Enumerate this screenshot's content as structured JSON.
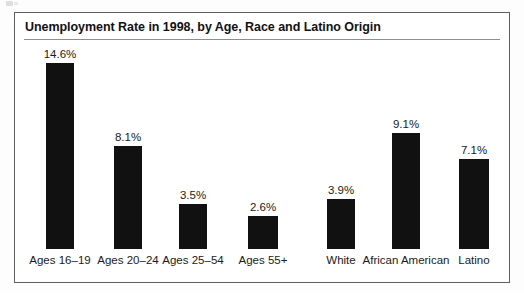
{
  "chart_data": {
    "type": "bar",
    "title": "Unemployment Rate in 1998, by Age, Race and Latino Origin",
    "xlabel": "",
    "ylabel": "",
    "ylim": [
      0,
      14.6
    ],
    "grid": false,
    "legend": "none",
    "value_suffix": "%",
    "categories": [
      "Ages 16–19",
      "Ages 20–24",
      "Ages 25–54",
      "Ages 55+",
      "White",
      "African American",
      "Latino"
    ],
    "values": [
      14.6,
      8.1,
      3.5,
      2.6,
      3.9,
      9.1,
      7.1
    ],
    "value_labels": [
      "14.6%",
      "8.1%",
      "3.5%",
      "2.6%",
      "3.9%",
      "9.1%",
      "7.1%"
    ],
    "bar_color": "#111111"
  },
  "frame": {
    "border_color": "#5f5f5f",
    "background": "#ffffff"
  }
}
